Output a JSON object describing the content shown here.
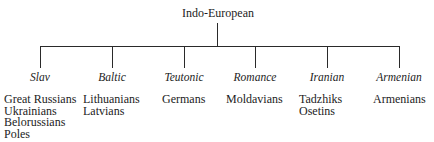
{
  "root": {
    "label": "Indo-European"
  },
  "branches": [
    {
      "label": "Slav",
      "x": 40,
      "members_left": 4,
      "members": [
        "Great Russians",
        "Ukrainians",
        "Belorussians",
        "Poles"
      ]
    },
    {
      "label": "Baltic",
      "x": 112,
      "members_left": 83,
      "members": [
        "Lithuanians",
        "Latvians"
      ]
    },
    {
      "label": "Teutonic",
      "x": 184,
      "members_left": 162,
      "members": [
        "Germans"
      ]
    },
    {
      "label": "Romance",
      "x": 255,
      "members_left": 226,
      "members": [
        "Moldavians"
      ]
    },
    {
      "label": "Iranian",
      "x": 327,
      "members_left": 299,
      "members": [
        "Tadzhiks",
        "Osetins"
      ]
    },
    {
      "label": "Armenian",
      "x": 399,
      "members_left": 373,
      "members": [
        "Armenians"
      ]
    }
  ]
}
